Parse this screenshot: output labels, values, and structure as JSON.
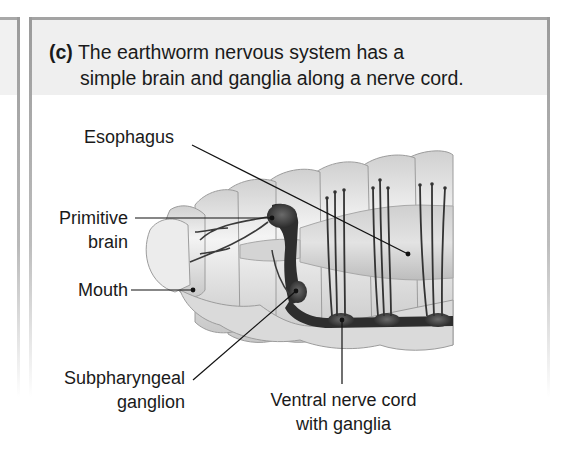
{
  "caption": {
    "tag": "(c)",
    "line1": "The earthworm nervous system has a",
    "line2": "simple brain and ganglia along a nerve cord."
  },
  "labels": {
    "esophagus": "Esophagus",
    "primitive_brain_1": "Primitive",
    "primitive_brain_2": "brain",
    "mouth": "Mouth",
    "subpharyngeal_1": "Subpharyngeal",
    "subpharyngeal_2": "ganglion",
    "ventral_1": "Ventral nerve cord",
    "ventral_2": "with ganglia"
  },
  "colors": {
    "panel_border": "#a3a3a3",
    "caption_band": "#efefef",
    "worm_body": "#e4e4e4",
    "nerve_tissue": "#2e2e2e",
    "text": "#1a1a1a"
  }
}
